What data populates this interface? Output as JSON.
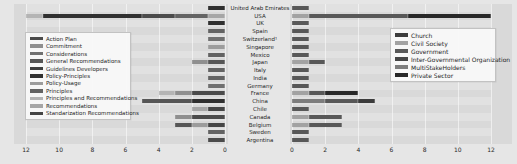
{
  "figure": {
    "background": "#e6e6e6",
    "plot_background": "#d9d9d9"
  },
  "countries_top_to_bottom": [
    "United Arab Emirates",
    "USA",
    "UK",
    "Spain",
    "Switzerland¹",
    "Singapore",
    "Mexico",
    "Japan",
    "Italy",
    "India",
    "Germany",
    "France",
    "China",
    "Chile",
    "Canada",
    "Belgium",
    "Sweden",
    "Argentina"
  ],
  "chart_data": {
    "type": "bar",
    "layout": "paired-horizontal-stacked-butterfly",
    "title": "",
    "grid": "on",
    "left_chart": {
      "axis_direction": "reversed",
      "xlim": [
        12,
        0
      ],
      "x_ticks": [
        12,
        10,
        8,
        6,
        4,
        2,
        0
      ],
      "legend_position": "center-left",
      "legend": [
        {
          "label": "Action Plan",
          "color": "#4b4b4b"
        },
        {
          "label": "Commitment",
          "color": "#8f8f8f"
        },
        {
          "label": "Considerations",
          "color": "#707070"
        },
        {
          "label": "General Recommendations",
          "color": "#565656"
        },
        {
          "label": "Guidelines Developers",
          "color": "#3e3e3e"
        },
        {
          "label": "Policy-Principles",
          "color": "#303030"
        },
        {
          "label": "Policy-Usage",
          "color": "#9c9c9c"
        },
        {
          "label": "Principles",
          "color": "#636363"
        },
        {
          "label": "Principles and Recommendations",
          "color": "#b4b4b4"
        },
        {
          "label": "Recommendations",
          "color": "#a6a6a6"
        },
        {
          "label": "Standarization Recommendations",
          "color": "#454545"
        }
      ],
      "rows": [
        {
          "country": "United Arab Emirates",
          "segments": [
            [
              "Policy-Principles",
              1
            ]
          ],
          "total": 1
        },
        {
          "country": "USA",
          "segments": [
            [
              "Recommendations",
              1
            ],
            [
              "Principles",
              2
            ],
            [
              "Action Plan",
              2
            ],
            [
              "Policy-Principles",
              6
            ],
            [
              "Principles and Recommendations",
              1
            ]
          ],
          "total": 12
        },
        {
          "country": "UK",
          "segments": [
            [
              "Policy-Principles",
              1
            ]
          ],
          "total": 1
        },
        {
          "country": "Spain",
          "segments": [
            [
              "Principles",
              1
            ]
          ],
          "total": 1
        },
        {
          "country": "Switzerland¹",
          "segments": [
            [
              "Considerations",
              1
            ]
          ],
          "total": 1
        },
        {
          "country": "Singapore",
          "segments": [
            [
              "Policy-Usage",
              1
            ]
          ],
          "total": 1
        },
        {
          "country": "Mexico",
          "segments": [
            [
              "Principles",
              1
            ]
          ],
          "total": 1
        },
        {
          "country": "Japan",
          "segments": [
            [
              "General Recommendations",
              1
            ],
            [
              "Commitment",
              1
            ]
          ],
          "total": 2
        },
        {
          "country": "Italy",
          "segments": [
            [
              "Principles",
              1
            ]
          ],
          "total": 1
        },
        {
          "country": "India",
          "segments": [
            [
              "Principles",
              1
            ]
          ],
          "total": 1
        },
        {
          "country": "Germany",
          "segments": [
            [
              "Considerations",
              1
            ]
          ],
          "total": 1
        },
        {
          "country": "France",
          "segments": [
            [
              "Action Plan",
              2
            ],
            [
              "Commitment",
              1
            ],
            [
              "Principles and Recommendations",
              1
            ]
          ],
          "total": 4
        },
        {
          "country": "China",
          "segments": [
            [
              "Policy-Principles",
              2
            ],
            [
              "General Recommendations",
              3
            ]
          ],
          "total": 5
        },
        {
          "country": "Chile",
          "segments": [
            [
              "Standarization Recommendations",
              1
            ],
            [
              "Recommendations",
              1
            ]
          ],
          "total": 2
        },
        {
          "country": "Canada",
          "segments": [
            [
              "Action Plan",
              2
            ],
            [
              "Commitment",
              1
            ]
          ],
          "total": 3
        },
        {
          "country": "Belgium",
          "segments": [
            [
              "Standarization Recommendations",
              1
            ],
            [
              "Policy-Usage",
              1
            ],
            [
              "General Recommendations",
              1
            ]
          ],
          "total": 3
        },
        {
          "country": "Sweden",
          "segments": [
            [
              "Principles",
              1
            ]
          ],
          "total": 1
        },
        {
          "country": "Argentina",
          "segments": [
            [
              "Action Plan",
              1
            ]
          ],
          "total": 1
        }
      ]
    },
    "right_chart": {
      "axis_direction": "normal",
      "xlim": [
        0,
        12
      ],
      "x_ticks": [
        0,
        2,
        4,
        6,
        8,
        10,
        12
      ],
      "legend_position": "top-right",
      "legend": [
        {
          "label": "Church",
          "color": "#3c3c3c"
        },
        {
          "label": "Civil Society",
          "color": "#a2a2a2"
        },
        {
          "label": "Government",
          "color": "#585858"
        },
        {
          "label": "Inter-Governmental Organization",
          "color": "#454545"
        },
        {
          "label": "MultiStakeHolders",
          "color": "#7d7d7d"
        },
        {
          "label": "Private Sector",
          "color": "#282828"
        }
      ],
      "rows": [
        {
          "country": "United Arab Emirates",
          "segments": [
            [
              "Government",
              1
            ]
          ],
          "total": 1
        },
        {
          "country": "USA",
          "segments": [
            [
              "Civil Society",
              1
            ],
            [
              "Government",
              6
            ],
            [
              "Private Sector",
              5
            ]
          ],
          "total": 12
        },
        {
          "country": "UK",
          "segments": [
            [
              "Government",
              1
            ]
          ],
          "total": 1
        },
        {
          "country": "Spain",
          "segments": [
            [
              "Government",
              1
            ]
          ],
          "total": 1
        },
        {
          "country": "Switzerland¹",
          "segments": [
            [
              "Government",
              1
            ]
          ],
          "total": 1
        },
        {
          "country": "Singapore",
          "segments": [
            [
              "Government",
              1
            ]
          ],
          "total": 1
        },
        {
          "country": "Mexico",
          "segments": [
            [
              "Government",
              1
            ]
          ],
          "total": 1
        },
        {
          "country": "Japan",
          "segments": [
            [
              "Civil Society",
              1
            ],
            [
              "Government",
              1
            ]
          ],
          "total": 2
        },
        {
          "country": "Italy",
          "segments": [
            [
              "Government",
              1
            ]
          ],
          "total": 1
        },
        {
          "country": "India",
          "segments": [
            [
              "Government",
              1
            ]
          ],
          "total": 1
        },
        {
          "country": "Germany",
          "segments": [
            [
              "Government",
              1
            ]
          ],
          "total": 1
        },
        {
          "country": "France",
          "segments": [
            [
              "Civil Society",
              1
            ],
            [
              "Government",
              1
            ],
            [
              "Private Sector",
              2
            ]
          ],
          "total": 4
        },
        {
          "country": "China",
          "segments": [
            [
              "MultiStakeHolders",
              2
            ],
            [
              "Government",
              2
            ],
            [
              "Church",
              1
            ]
          ],
          "total": 5
        },
        {
          "country": "Chile",
          "segments": [
            [
              "Government",
              1
            ]
          ],
          "total": 1
        },
        {
          "country": "Canada",
          "segments": [
            [
              "Civil Society",
              1
            ],
            [
              "Government",
              2
            ]
          ],
          "total": 3
        },
        {
          "country": "Belgium",
          "segments": [
            [
              "Civil Society",
              1
            ],
            [
              "Government",
              2
            ]
          ],
          "total": 3
        },
        {
          "country": "Sweden",
          "segments": [
            [
              "Government",
              1
            ]
          ],
          "total": 1
        },
        {
          "country": "Argentina",
          "segments": [
            [
              "Government",
              1
            ]
          ],
          "total": 1
        }
      ]
    }
  }
}
